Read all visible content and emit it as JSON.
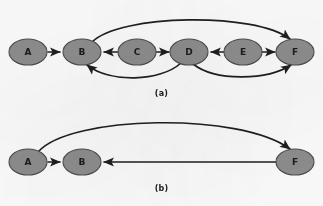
{
  "figure": {
    "background_color": "#fbfbfb",
    "node_fill_color": "#8d8d8d",
    "node_stroke_color": "#4c4c4c",
    "edge_color": "#1f1f1f",
    "label_color": "#1c1c1c"
  },
  "panels": [
    {
      "id": "a",
      "caption": "(a)",
      "nodes": [
        {
          "id": "A",
          "label": "A",
          "cx": 28,
          "cy": 52
        },
        {
          "id": "B",
          "label": "B",
          "cx": 82,
          "cy": 52
        },
        {
          "id": "C",
          "label": "C",
          "cx": 137,
          "cy": 52
        },
        {
          "id": "D",
          "label": "D",
          "cx": 189,
          "cy": 52
        },
        {
          "id": "E",
          "label": "E",
          "cx": 243,
          "cy": 52
        },
        {
          "id": "F",
          "label": "F",
          "cx": 295,
          "cy": 52
        }
      ],
      "edges": [
        {
          "from": "A",
          "to": "B",
          "shape": "straight",
          "direction": "right"
        },
        {
          "from": "C",
          "to": "B",
          "shape": "straight",
          "direction": "left"
        },
        {
          "from": "C",
          "to": "D",
          "shape": "straight",
          "direction": "right"
        },
        {
          "from": "E",
          "to": "D",
          "shape": "straight",
          "direction": "left"
        },
        {
          "from": "E",
          "to": "F",
          "shape": "straight",
          "direction": "right"
        },
        {
          "from": "B",
          "to": "F",
          "shape": "curve-above",
          "direction": "right"
        },
        {
          "from": "D",
          "to": "B",
          "shape": "curve-below",
          "direction": "left"
        },
        {
          "from": "D",
          "to": "F",
          "shape": "curve-below",
          "direction": "right"
        }
      ]
    },
    {
      "id": "b",
      "caption": "(b)",
      "nodes": [
        {
          "id": "A",
          "label": "A",
          "cx": 28,
          "cy": 59
        },
        {
          "id": "B",
          "label": "B",
          "cx": 82,
          "cy": 59
        },
        {
          "id": "F",
          "label": "F",
          "cx": 295,
          "cy": 59
        }
      ],
      "edges": [
        {
          "from": "A",
          "to": "B",
          "shape": "straight",
          "direction": "right"
        },
        {
          "from": "F",
          "to": "B",
          "shape": "straight",
          "direction": "left"
        },
        {
          "from": "A",
          "to": "F",
          "shape": "curve-above",
          "direction": "right"
        }
      ]
    }
  ]
}
